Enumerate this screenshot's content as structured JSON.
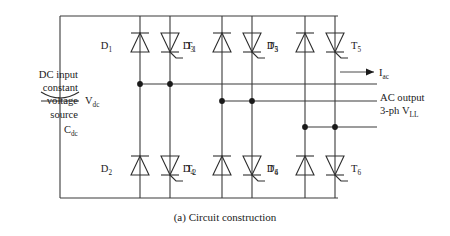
{
  "figure": {
    "caption": "(a) Circuit construction"
  },
  "labels": {
    "dc_input": {
      "line1": "DC input",
      "line2": "constant",
      "line3": "voltage",
      "line4": "source"
    },
    "v_dc": {
      "base": "V",
      "sub": "dc"
    },
    "c_dc": {
      "base": "C",
      "sub": "dc"
    },
    "i_ac": {
      "base": "I",
      "sub": "ac"
    },
    "ac_output": {
      "line1": "AC output",
      "line2_base": "3-ph V",
      "line2_sub": "LL"
    }
  },
  "devices": [
    {
      "name": "D1",
      "base": "D",
      "sub": "1",
      "type": "diode",
      "leg": "upper",
      "phase": "A"
    },
    {
      "name": "T1",
      "base": "T",
      "sub": "1",
      "type": "thyristor",
      "leg": "upper",
      "phase": "A"
    },
    {
      "name": "D3",
      "base": "D",
      "sub": "3",
      "type": "diode",
      "leg": "upper",
      "phase": "B"
    },
    {
      "name": "T3",
      "base": "T",
      "sub": "3",
      "type": "thyristor",
      "leg": "upper",
      "phase": "B"
    },
    {
      "name": "D5",
      "base": "D",
      "sub": "5",
      "type": "diode",
      "leg": "upper",
      "phase": "C"
    },
    {
      "name": "T5",
      "base": "T",
      "sub": "5",
      "type": "thyristor",
      "leg": "upper",
      "phase": "C"
    },
    {
      "name": "D2",
      "base": "D",
      "sub": "2",
      "type": "diode",
      "leg": "lower",
      "phase": "A"
    },
    {
      "name": "T2",
      "base": "T",
      "sub": "2",
      "type": "thyristor",
      "leg": "lower",
      "phase": "A"
    },
    {
      "name": "D4",
      "base": "D",
      "sub": "4",
      "type": "diode",
      "leg": "lower",
      "phase": "B"
    },
    {
      "name": "T4",
      "base": "T",
      "sub": "4",
      "type": "thyristor",
      "leg": "lower",
      "phase": "B"
    },
    {
      "name": "D6",
      "base": "D",
      "sub": "6",
      "type": "diode",
      "leg": "lower",
      "phase": "C"
    },
    {
      "name": "T6",
      "base": "T",
      "sub": "6",
      "type": "thyristor",
      "leg": "lower",
      "phase": "C"
    }
  ],
  "colors": {
    "wire": "#3a3a3a",
    "device": "#2e2e2e",
    "node": "#1a1a1a",
    "text": "#1a1a1a",
    "background": "#ffffff"
  }
}
